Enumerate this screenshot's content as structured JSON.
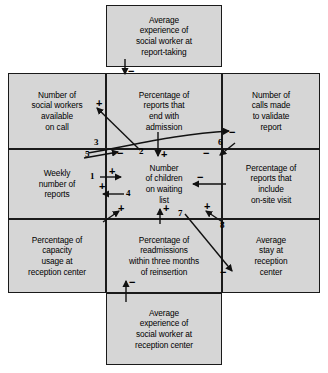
{
  "diagram": {
    "title_note": "Causal loop / cross-impact diagram of reception center process",
    "background_color": "#d6d6d6",
    "line_color": "#1a1a1a",
    "cells": [
      {
        "id": "top",
        "text": "Average\nexperience of\nsocial worker at\nreport-taking"
      },
      {
        "id": "mid-left",
        "text": "Number of\nsocial workers\navailable\non call"
      },
      {
        "id": "mid-center",
        "text": "Percentage of\nreports that\nend with\nadmission"
      },
      {
        "id": "mid-right",
        "text": "Number of\ncalls made\nto validate\nreport"
      },
      {
        "id": "row2-left",
        "text": "Weekly\nnumber of\nreports"
      },
      {
        "id": "row2-center",
        "text": "Number\nof children\non waiting\nlist"
      },
      {
        "id": "row2-right",
        "text": "Percentage of\nreports that\ninclude\non-site visit"
      },
      {
        "id": "row3-left",
        "text": "Percentage of\ncapacity\nusage at\nreception center"
      },
      {
        "id": "row3-center",
        "text": "Percentage of\nreadmissions\nwithin three months\nof reinsertion"
      },
      {
        "id": "row3-right",
        "text": "Average\nstay at\nreception\ncenter"
      },
      {
        "id": "bottom",
        "text": "Average\nexperience of\nsocial worker at\nreception center"
      }
    ],
    "arrow_numbers": [
      {
        "id": "n1",
        "label": "1"
      },
      {
        "id": "n2",
        "label": "2"
      },
      {
        "id": "n3",
        "label": "3"
      },
      {
        "id": "n4",
        "label": "4"
      },
      {
        "id": "n5",
        "label": "5"
      },
      {
        "id": "n6",
        "label": "6"
      },
      {
        "id": "n7",
        "label": "7"
      },
      {
        "id": "n8",
        "label": "8"
      }
    ],
    "polarity_signs": [
      {
        "id": "s-top",
        "label": "−"
      },
      {
        "id": "s-swplus",
        "label": "+"
      },
      {
        "id": "s-admission-down",
        "label": "+"
      },
      {
        "id": "s-three-minus",
        "label": "−"
      },
      {
        "id": "s-six-minus",
        "label": "−"
      },
      {
        "id": "s-six-arrowminus",
        "label": "−"
      },
      {
        "id": "s-one-plus",
        "label": "+"
      },
      {
        "id": "s-four-plus",
        "label": "+"
      },
      {
        "id": "s-onsite-minus",
        "label": "−"
      },
      {
        "id": "s-cap-plus",
        "label": "+"
      },
      {
        "id": "s-readm-plus",
        "label": "+"
      },
      {
        "id": "s-eight-plus",
        "label": "+"
      },
      {
        "id": "s-seven-minus",
        "label": "−"
      },
      {
        "id": "s-bottom-minus",
        "label": "−"
      }
    ]
  }
}
